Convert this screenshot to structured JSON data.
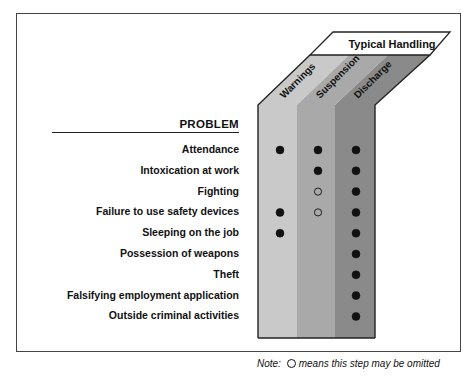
{
  "header": {
    "title": "Typical Handling",
    "problem_heading": "PROBLEM"
  },
  "columns": [
    {
      "label": "Warnings",
      "color": "#c9c9c9"
    },
    {
      "label": "Suspension",
      "color": "#a9a9a9"
    },
    {
      "label": "Discharge",
      "color": "#8a8a8a"
    }
  ],
  "rows": [
    {
      "label": "Attendance",
      "marks": [
        "filled",
        "filled",
        "filled"
      ]
    },
    {
      "label": "Intoxication at work",
      "marks": [
        "none",
        "filled",
        "filled"
      ]
    },
    {
      "label": "Fighting",
      "marks": [
        "none",
        "open",
        "filled"
      ]
    },
    {
      "label": "Failure to use safety devices",
      "marks": [
        "filled",
        "open",
        "filled"
      ]
    },
    {
      "label": "Sleeping on the job",
      "marks": [
        "filled",
        "none",
        "filled"
      ]
    },
    {
      "label": "Possession of weapons",
      "marks": [
        "none",
        "none",
        "filled"
      ]
    },
    {
      "label": "Theft",
      "marks": [
        "none",
        "none",
        "filled"
      ]
    },
    {
      "label": "Falsifying employment application",
      "marks": [
        "none",
        "none",
        "filled"
      ]
    },
    {
      "label": "Outside criminal activities",
      "marks": [
        "none",
        "none",
        "filled"
      ]
    }
  ],
  "note": {
    "prefix": "Note:",
    "text": "means this step may be omitted",
    "symbol": "open-circle"
  },
  "legend_symbols": {
    "filled": "filled-circle = typical step",
    "open": "open-circle = step may be omitted"
  }
}
